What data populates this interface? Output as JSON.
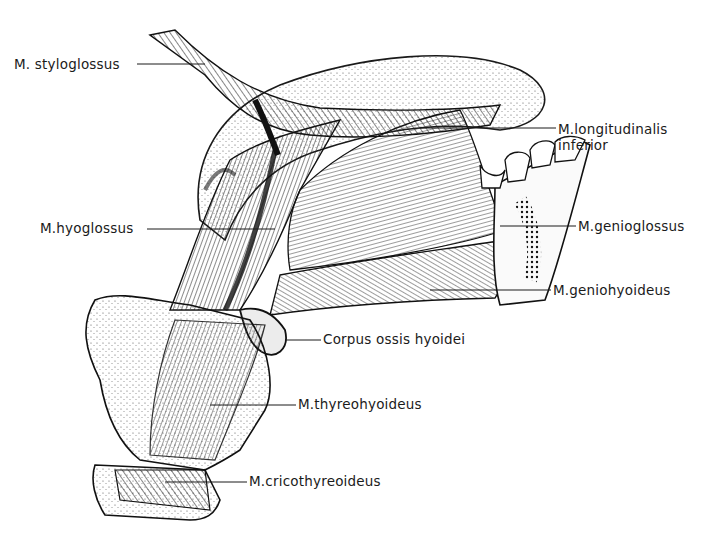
{
  "figure": {
    "colors": {
      "ink": "#1a1a1a",
      "paper": "#ffffff",
      "stipple": "#6a6a6a"
    }
  },
  "labels": [
    {
      "id": "styloglossus",
      "text": "M. styloglossus",
      "x": 14,
      "y": 56,
      "side": "left",
      "line": [
        137,
        64,
        205,
        64
      ]
    },
    {
      "id": "longitudinalis",
      "text": "M.longitudinalis\ninferior",
      "x": 558,
      "y": 121,
      "side": "right",
      "line": [
        420,
        128,
        556,
        128
      ]
    },
    {
      "id": "hyoglossus",
      "text": "M.hyoglossus",
      "x": 40,
      "y": 220,
      "side": "left",
      "line": [
        147,
        229,
        275,
        229
      ]
    },
    {
      "id": "genioglossus",
      "text": "M.genioglossus",
      "x": 578,
      "y": 218,
      "side": "right",
      "line": [
        500,
        226,
        576,
        226
      ]
    },
    {
      "id": "geniohyoideus",
      "text": "M.geniohyoideus",
      "x": 553,
      "y": 282,
      "side": "right",
      "line": [
        430,
        290,
        551,
        290
      ]
    },
    {
      "id": "corpus_hyoidei",
      "text": "Corpus ossis hyoidei",
      "x": 323,
      "y": 331,
      "side": "right",
      "line": [
        285,
        340,
        321,
        340
      ]
    },
    {
      "id": "thyreohyoideus",
      "text": "M.thyreohyoideus",
      "x": 298,
      "y": 396,
      "side": "right",
      "line": [
        210,
        405,
        296,
        405
      ]
    },
    {
      "id": "cricothyreoideus",
      "text": "M.cricothyreoideus",
      "x": 249,
      "y": 473,
      "side": "right",
      "line": [
        165,
        482,
        247,
        482
      ]
    }
  ]
}
